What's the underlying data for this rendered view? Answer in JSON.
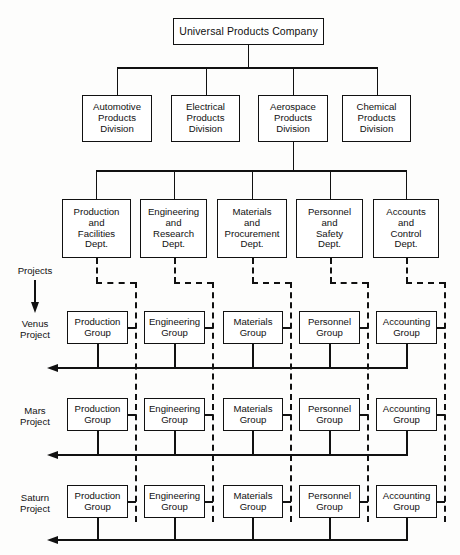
{
  "chart": {
    "title": "Universal Products Company",
    "type": "matrix-organization-chart"
  },
  "root": {
    "label": "Universal Products Company"
  },
  "divisions": [
    {
      "line1": "Automotive",
      "line2": "Products",
      "line3": "Division"
    },
    {
      "line1": "Electrical",
      "line2": "Products",
      "line3": "Division"
    },
    {
      "line1": "Aerospace",
      "line2": "Products",
      "line3": "Division"
    },
    {
      "line1": "Chemical",
      "line2": "Products",
      "line3": "Division"
    }
  ],
  "departments": [
    {
      "line1": "Production",
      "line2": "and",
      "line3": "Facilities",
      "line4": "Dept."
    },
    {
      "line1": "Engineering",
      "line2": "and",
      "line3": "Research",
      "line4": "Dept."
    },
    {
      "line1": "Materials",
      "line2": "and",
      "line3": "Procurement",
      "line4": "Dept."
    },
    {
      "line1": "Personnel",
      "line2": "and",
      "line3": "Safety",
      "line4": "Dept."
    },
    {
      "line1": "Accounts",
      "line2": "and",
      "line3": "Control",
      "line4": "Dept."
    }
  ],
  "projects_axis": {
    "label": "Projects"
  },
  "projects": [
    {
      "name_line1": "Venus",
      "name_line2": "Project",
      "groups": [
        {
          "line1": "Production",
          "line2": "Group"
        },
        {
          "line1": "Engineering",
          "line2": "Group"
        },
        {
          "line1": "Materials",
          "line2": "Group"
        },
        {
          "line1": "Personnel",
          "line2": "Group"
        },
        {
          "line1": "Accounting",
          "line2": "Group"
        }
      ]
    },
    {
      "name_line1": "Mars",
      "name_line2": "Project",
      "groups": [
        {
          "line1": "Production",
          "line2": "Group"
        },
        {
          "line1": "Engineering",
          "line2": "Group"
        },
        {
          "line1": "Materials",
          "line2": "Group"
        },
        {
          "line1": "Personnel",
          "line2": "Group"
        },
        {
          "line1": "Accounting",
          "line2": "Group"
        }
      ]
    },
    {
      "name_line1": "Saturn",
      "name_line2": "Project",
      "groups": [
        {
          "line1": "Production",
          "line2": "Group"
        },
        {
          "line1": "Engineering",
          "line2": "Group"
        },
        {
          "line1": "Materials",
          "line2": "Group"
        },
        {
          "line1": "Personnel",
          "line2": "Group"
        },
        {
          "line1": "Accounting",
          "line2": "Group"
        }
      ]
    }
  ],
  "colors": {
    "line": "#111111",
    "box_fill": "#ffffff",
    "background": "#fdfdfc",
    "text": "#111111"
  }
}
